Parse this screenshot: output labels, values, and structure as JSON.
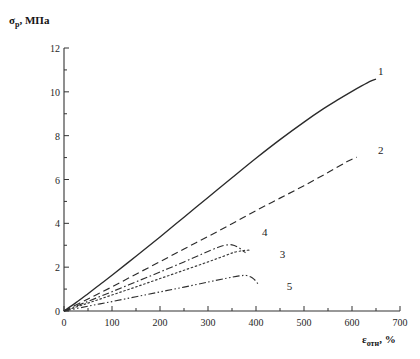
{
  "chart_data": {
    "type": "line",
    "title": "",
    "xlabel": "εотн, %",
    "xlabel_base": "ε",
    "xlabel_sub": "отн",
    "xlabel_unit": ", %",
    "ylabel": "σр, МПа",
    "ylabel_base": "σ",
    "ylabel_sub": "р",
    "ylabel_unit": ", МПа",
    "xlim": [
      0,
      700
    ],
    "ylim": [
      0,
      12
    ],
    "x_major_step": 100,
    "x_minor_step": 50,
    "y_major_step": 2,
    "y_minor_step": 1,
    "grid": false,
    "legend_position": "inline-curve-end-labels",
    "x_tick_labels": [
      "0",
      "100",
      "200",
      "300",
      "400",
      "500",
      "600",
      "700"
    ],
    "y_tick_labels": [
      "0",
      "2",
      "4",
      "6",
      "8",
      "10",
      "12"
    ],
    "series": [
      {
        "name": "1",
        "label": "1",
        "style": "solid",
        "color": "#2b2b2b",
        "label_x": 660,
        "label_y": 10.95,
        "points": [
          [
            0,
            0
          ],
          [
            25,
            0.38
          ],
          [
            50,
            0.79
          ],
          [
            75,
            1.21
          ],
          [
            100,
            1.63
          ],
          [
            150,
            2.5
          ],
          [
            200,
            3.38
          ],
          [
            250,
            4.28
          ],
          [
            300,
            5.18
          ],
          [
            350,
            6.08
          ],
          [
            400,
            6.97
          ],
          [
            450,
            7.82
          ],
          [
            500,
            8.62
          ],
          [
            540,
            9.22
          ],
          [
            570,
            9.63
          ],
          [
            600,
            10.02
          ],
          [
            620,
            10.27
          ],
          [
            640,
            10.5
          ],
          [
            650,
            10.58
          ]
        ]
      },
      {
        "name": "2",
        "label": "2",
        "style": "dashed",
        "color": "#2b2b2b",
        "label_x": 660,
        "label_y": 7.35,
        "points": [
          [
            0,
            0
          ],
          [
            50,
            0.55
          ],
          [
            100,
            1.1
          ],
          [
            150,
            1.68
          ],
          [
            200,
            2.25
          ],
          [
            250,
            2.83
          ],
          [
            300,
            3.4
          ],
          [
            350,
            3.98
          ],
          [
            400,
            4.58
          ],
          [
            450,
            5.15
          ],
          [
            500,
            5.72
          ],
          [
            550,
            6.32
          ],
          [
            590,
            6.82
          ],
          [
            610,
            7.02
          ]
        ]
      },
      {
        "name": "3",
        "label": "3",
        "style": "dotted",
        "color": "#3a3a3a",
        "label_x": 455,
        "label_y": 2.58,
        "points": [
          [
            0,
            0
          ],
          [
            50,
            0.36
          ],
          [
            100,
            0.73
          ],
          [
            150,
            1.1
          ],
          [
            200,
            1.48
          ],
          [
            250,
            1.86
          ],
          [
            300,
            2.24
          ],
          [
            330,
            2.48
          ],
          [
            355,
            2.68
          ],
          [
            375,
            2.76
          ],
          [
            390,
            2.78
          ]
        ]
      },
      {
        "name": "4",
        "label": "4",
        "style": "dashdot",
        "color": "#2f2f2f",
        "label_x": 418,
        "label_y": 3.6,
        "points": [
          [
            0,
            0
          ],
          [
            50,
            0.44
          ],
          [
            100,
            0.88
          ],
          [
            150,
            1.33
          ],
          [
            200,
            1.78
          ],
          [
            250,
            2.24
          ],
          [
            290,
            2.62
          ],
          [
            320,
            2.9
          ],
          [
            335,
            3.0
          ],
          [
            350,
            3.02
          ],
          [
            362,
            2.92
          ],
          [
            372,
            2.76
          ],
          [
            378,
            2.66
          ]
        ]
      },
      {
        "name": "5",
        "label": "5",
        "style": "dashdotdot",
        "color": "#2f2f2f",
        "label_x": 470,
        "label_y": 1.12,
        "points": [
          [
            0,
            0
          ],
          [
            50,
            0.22
          ],
          [
            100,
            0.43
          ],
          [
            150,
            0.65
          ],
          [
            200,
            0.87
          ],
          [
            250,
            1.09
          ],
          [
            300,
            1.32
          ],
          [
            340,
            1.5
          ],
          [
            365,
            1.6
          ],
          [
            380,
            1.62
          ],
          [
            392,
            1.52
          ],
          [
            400,
            1.36
          ],
          [
            404,
            1.24
          ]
        ]
      }
    ]
  },
  "plot_geometry": {
    "left_px": 64,
    "right_px": 400,
    "top_px": 48,
    "bottom_px": 311
  }
}
